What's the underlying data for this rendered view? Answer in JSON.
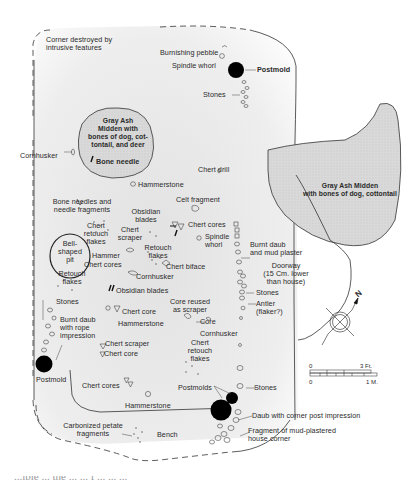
{
  "figure": {
    "type": "archaeological house floor plan",
    "labels": {
      "corner_destroyed": "Corner destroyed by\nintrusive features",
      "burnishing_pebble": "Burnishing pebble",
      "spindle_whorl_top": "Spindle whorl",
      "postmold_top": "Postmold",
      "stones_top": "Stones",
      "midden_left": "Gray Ash\nMidden with\nbones of dog, cot-\ntontail, and deer",
      "cornhusker_left": "Cornhusker",
      "bone_needle": "Bone needle",
      "chert_drill": "Chert drill",
      "hammerstone_1": "Hammerstone",
      "midden_right": "Gray Ash Midden\nwith bones of dog, cottontail",
      "bone_needles": "Bone needles and\nneedle fragments",
      "celt_fragment": "Celt fragment",
      "obsidian_blades_1": "Obsidian\nblades",
      "chert_cores_1": "Chert cores",
      "chert_retouch_1": "Chert\nretouch\nflakes",
      "chert_scraper_1": "Chert\nscraper",
      "spindle_whorl_mid": "Spindle\nwhorl",
      "burnt_daub_mud": "Burnt daub\nand mud plaster",
      "bell_pit": "Bell-\nshaped\npit",
      "retouch_flakes_1": "Retouch\nflakes",
      "hammer": "Hammer",
      "chert_cores_2": "Chert cores",
      "chert_biface": "Chert biface",
      "doorway": "Doorway\n(15 Cm. lower\nthan house)",
      "retouch_flakes_2": "Retouch\nflakes",
      "cornhusker_mid": "Cornhusker",
      "obsidian_blades_2": "Obsidian blades",
      "stones_door": "Stones",
      "stones_left": "Stones",
      "core_reused": "Core reused\nas scraper",
      "antler": "Antler\n(flaker?)",
      "chert_core_1": "Chert core",
      "burnt_daub_rope": "Burnt daub\nwith rope\nimpression",
      "hammerstone_2": "Hammerstone",
      "core": "Core",
      "cornhusker_right": "Cornhusker",
      "chert_scraper_2": "Chert scraper",
      "chert_core_2": "Chert core",
      "chert_retouch_2": "Chert\nretouch\nflakes",
      "postmold_left": "Postmold",
      "chert_cores_3": "Chert cores",
      "postmolds": "Postmolds",
      "stones_bottom": "Stones",
      "hammerstone_3": "Hammerstone",
      "daub_corner": "Daub with corner post impression",
      "carbonized_petate": "Carbonized petate\nfragments",
      "bench": "Bench",
      "mud_corner": "Fragment of mud-plastered\nhouse corner"
    },
    "north_arrow": {
      "label": "N"
    },
    "scale_bar": {
      "top_start": "0",
      "top_end": "3 Ft.",
      "bottom_start": "0",
      "bottom_end": "1 M."
    },
    "caption_partial": "...ible ... the ... ... f ... ... ..."
  },
  "colors": {
    "ink": "#2a2a2a",
    "midden_fill": "#dcdcdc",
    "floor_shade": "#e9e9e9",
    "postmold": "#000000"
  }
}
